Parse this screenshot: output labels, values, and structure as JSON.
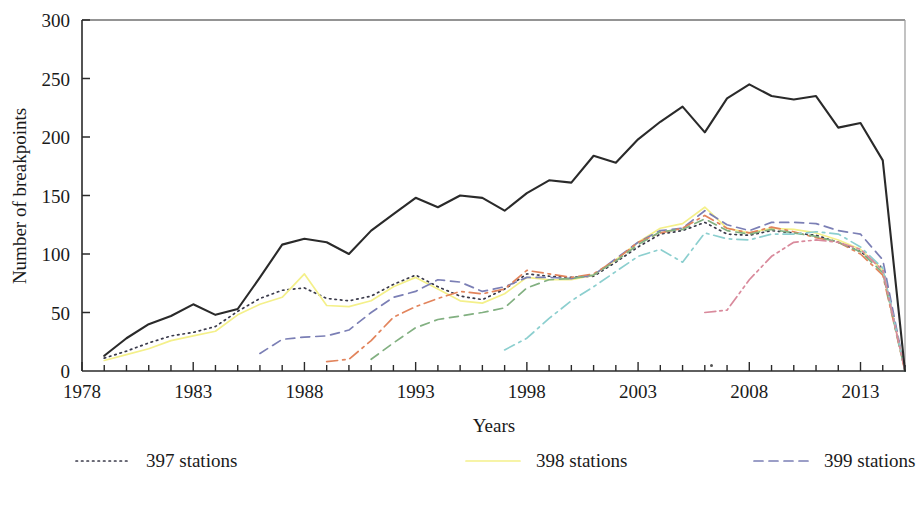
{
  "chart_data": {
    "type": "line",
    "title": "",
    "xlabel": "Years",
    "ylabel": "Number of breakpoints",
    "xlim": [
      1978,
      2015
    ],
    "ylim": [
      0,
      300
    ],
    "xticks": [
      1978,
      1983,
      1988,
      1993,
      1998,
      2003,
      2008,
      2013
    ],
    "xtick_labels": [
      "1978",
      "1983",
      "1988",
      "1993",
      "1998",
      "2003",
      "2008",
      "2013"
    ],
    "yticks": [
      0,
      50,
      100,
      150,
      200,
      250,
      300
    ],
    "ytick_labels": [
      "0",
      "50",
      "100",
      "150",
      "200",
      "250",
      "300"
    ],
    "xtick_minor_step": 1,
    "grid": false,
    "legend_position": "bottom",
    "legend_columns": 3,
    "series": [
      {
        "name": "397 stations",
        "color": "#3a3a4a",
        "dash": "dotted",
        "x": [
          1979,
          1980,
          1981,
          1982,
          1983,
          1984,
          1985,
          1986,
          1987,
          1988,
          1989,
          1990,
          1991,
          1992,
          1993,
          1994,
          1995,
          1996,
          1997,
          1998,
          1999,
          2000,
          2001,
          2002,
          2003,
          2004,
          2005,
          2006,
          2007,
          2008,
          2009,
          2010,
          2011,
          2012,
          2013,
          2014,
          2015
        ],
        "y": [
          11,
          17,
          24,
          30,
          33,
          38,
          51,
          62,
          69,
          71,
          62,
          60,
          64,
          74,
          82,
          72,
          64,
          61,
          70,
          83,
          81,
          80,
          81,
          93,
          106,
          117,
          120,
          127,
          117,
          116,
          120,
          118,
          116,
          110,
          102,
          88,
          0
        ]
      },
      {
        "name": "398 stations",
        "color": "#f4f08a",
        "dash": "solid",
        "x": [
          1979,
          1980,
          1981,
          1982,
          1983,
          1984,
          1985,
          1986,
          1987,
          1988,
          1989,
          1990,
          1991,
          1992,
          1993,
          1994,
          1995,
          1996,
          1997,
          1998,
          1999,
          2000,
          2001,
          2002,
          2003,
          2004,
          2005,
          2006,
          2007,
          2008,
          2009,
          2010,
          2011,
          2012,
          2013,
          2014,
          2015
        ],
        "y": [
          9,
          14,
          19,
          26,
          30,
          34,
          48,
          57,
          63,
          83,
          56,
          55,
          60,
          72,
          80,
          70,
          60,
          58,
          66,
          80,
          78,
          78,
          82,
          95,
          110,
          122,
          126,
          140,
          122,
          118,
          122,
          121,
          118,
          112,
          104,
          86,
          0
        ]
      },
      {
        "name": "399 stations",
        "color": "#7b7fb5",
        "dash": "dashed",
        "x": [
          1986,
          1987,
          1988,
          1989,
          1990,
          1991,
          1992,
          1993,
          1994,
          1995,
          1996,
          1997,
          1998,
          1999,
          2000,
          2001,
          2002,
          2003,
          2004,
          2005,
          2006,
          2007,
          2008,
          2009,
          2010,
          2011,
          2012,
          2013,
          2014,
          2015
        ],
        "y": [
          15,
          27,
          29,
          30,
          35,
          50,
          63,
          68,
          78,
          76,
          68,
          72,
          80,
          80,
          79,
          82,
          96,
          110,
          120,
          122,
          137,
          125,
          120,
          127,
          127,
          126,
          120,
          117,
          95,
          0
        ]
      },
      {
        "name": "400 stations",
        "color": "#e2845c",
        "dash": "dashdot",
        "x": [
          1989,
          1990,
          1991,
          1992,
          1993,
          1994,
          1995,
          1996,
          1997,
          1998,
          1999,
          2000,
          2001,
          2002,
          2003,
          2004,
          2005,
          2006,
          2007,
          2008,
          2009,
          2010,
          2011,
          2012,
          2013,
          2014,
          2015
        ],
        "y": [
          8,
          10,
          26,
          46,
          55,
          62,
          68,
          66,
          70,
          86,
          83,
          80,
          83,
          95,
          110,
          118,
          122,
          133,
          122,
          118,
          123,
          119,
          114,
          110,
          100,
          82,
          0
        ]
      },
      {
        "name": "402 stations",
        "color": "#82b081",
        "dash": "dashed",
        "x": [
          1991,
          1992,
          1993,
          1994,
          1995,
          1996,
          1997,
          1998,
          1999,
          2000,
          2001,
          2002,
          2003,
          2004,
          2005,
          2006,
          2007,
          2008,
          2009,
          2010,
          2011,
          2012,
          2013,
          2014,
          2015
        ],
        "y": [
          10,
          24,
          37,
          44,
          47,
          50,
          54,
          71,
          78,
          79,
          82,
          94,
          108,
          119,
          121,
          130,
          120,
          117,
          121,
          118,
          115,
          110,
          102,
          84,
          0
        ]
      },
      {
        "name": "403 stations",
        "color": "#8ccfcf",
        "dash": "dashdot",
        "x": [
          1997,
          1998,
          1999,
          2000,
          2001,
          2002,
          2003,
          2004,
          2005,
          2006,
          2007,
          2008,
          2009,
          2010,
          2011,
          2012,
          2013,
          2014,
          2015
        ],
        "y": [
          18,
          28,
          45,
          60,
          72,
          85,
          98,
          104,
          93,
          118,
          113,
          112,
          117,
          117,
          119,
          117,
          106,
          88,
          0
        ]
      },
      {
        "name": "404 stations",
        "color": "#d98a9c",
        "dash": "dashdotdot",
        "x": [
          2006,
          2007,
          2008,
          2009,
          2010,
          2011,
          2012,
          2013,
          2014,
          2015
        ],
        "y": [
          50,
          52,
          78,
          98,
          110,
          112,
          110,
          104,
          86,
          0
        ]
      },
      {
        "name": "Total",
        "color": "#2a2a2a",
        "dash": "solid",
        "x": [
          1979,
          1980,
          1981,
          1982,
          1983,
          1984,
          1985,
          1986,
          1987,
          1988,
          1989,
          1990,
          1991,
          1992,
          1993,
          1994,
          1995,
          1996,
          1997,
          1998,
          1999,
          2000,
          2001,
          2002,
          2003,
          2004,
          2005,
          2006,
          2007,
          2008,
          2009,
          2010,
          2011,
          2012,
          2013,
          2014,
          2015
        ],
        "y": [
          13,
          28,
          40,
          47,
          57,
          48,
          53,
          80,
          108,
          113,
          110,
          100,
          120,
          134,
          148,
          140,
          150,
          148,
          137,
          152,
          163,
          161,
          184,
          178,
          198,
          213,
          226,
          204,
          233,
          245,
          235,
          232,
          235,
          208,
          212,
          180,
          0
        ]
      }
    ]
  },
  "legend": {
    "items": [
      {
        "label": "397 stations",
        "color": "#3a3a4a",
        "dash": "dotted"
      },
      {
        "label": "398 stations",
        "color": "#f4f08a",
        "dash": "solid"
      },
      {
        "label": "399 stations",
        "color": "#7b7fb5",
        "dash": "dashed"
      },
      {
        "label": "400 stations",
        "color": "#e2845c",
        "dash": "dashdot"
      },
      {
        "label": "402 stations",
        "color": "#82b081",
        "dash": "dashed"
      },
      {
        "label": "403 stations",
        "color": "#8ccfcf",
        "dash": "dashdot"
      },
      {
        "label": "404 stations",
        "color": "#d98a9c",
        "dash": "dashdotdot"
      },
      {
        "label": "Total",
        "color": "#2a2a2a",
        "dash": "solid"
      }
    ]
  }
}
